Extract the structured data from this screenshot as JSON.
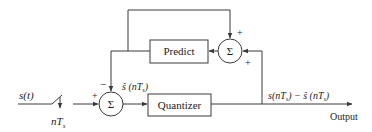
{
  "diagram": {
    "type": "block-diagram",
    "input_label": "s(t)",
    "sampler_label": "nT",
    "sampler_subscript": "s",
    "blocks": {
      "predict": "Predict",
      "quantizer": "Quantizer"
    },
    "summers": {
      "input_sum": {
        "symbol": "Σ",
        "sign_left": "+",
        "sign_top": "−"
      },
      "feedback_sum": {
        "symbol": "Σ",
        "sign_top": "+",
        "sign_right": "+"
      }
    },
    "prediction_label": "ŝ (nT",
    "prediction_label_close": ")",
    "error_label": "s(nT",
    "error_label_mid": ") − ŝ (nT",
    "error_label_close": ")",
    "output_label": "Output",
    "colors": {
      "line": "#3a3a3a",
      "text": "#222222",
      "background": "#ffffff"
    }
  }
}
